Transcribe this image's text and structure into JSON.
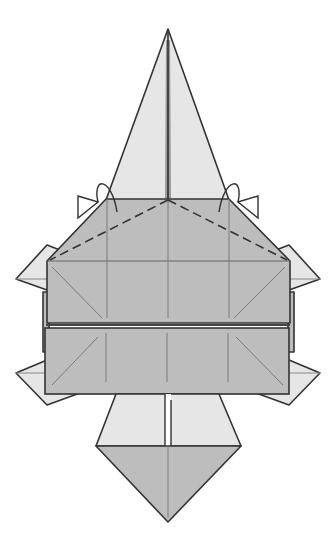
{
  "diagram": {
    "type": "origami-fold-step",
    "colors": {
      "background": "#ffffff",
      "paper_light": "#e6e6e6",
      "paper_dark": "#bdbdbd",
      "line": "#333333",
      "crease": "#7a7a7a"
    },
    "symbols": [
      {
        "name": "valley-fold-line-left",
        "style": "dashed"
      },
      {
        "name": "valley-fold-line-right",
        "style": "dashed"
      },
      {
        "name": "fold-behind-arrow-left",
        "style": "curved-arrow"
      },
      {
        "name": "fold-behind-arrow-right",
        "style": "curved-arrow"
      }
    ],
    "parts": [
      "top-point",
      "upper-panel",
      "lower-panel",
      "side-flaps",
      "bottom-point"
    ]
  }
}
